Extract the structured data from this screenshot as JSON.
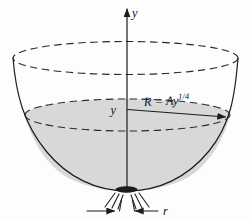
{
  "labels": {
    "y_axis": "y",
    "water_height": "y",
    "radius_formula_base": "R = Ay",
    "radius_formula_exponent": "1/4",
    "drain_radius": "r"
  },
  "colors": {
    "line": "#1c1c1c",
    "water_fill": "#d8d8d8",
    "background": "#fdfdfd"
  }
}
